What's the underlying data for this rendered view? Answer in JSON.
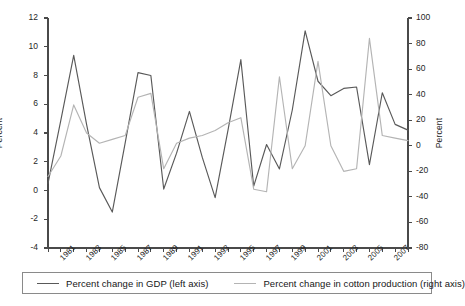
{
  "chart_data": {
    "type": "line",
    "title": "",
    "xlabel": "",
    "ylabel": "Percent",
    "y2label": "Percent",
    "grid": false,
    "legend_position": "bottom",
    "x": [
      1980,
      1981,
      1982,
      1983,
      1984,
      1985,
      1986,
      1987,
      1988,
      1989,
      1990,
      1991,
      1992,
      1993,
      1994,
      1995,
      1996,
      1997,
      1998,
      1999,
      2000,
      2001,
      2002,
      2003,
      2004,
      2005,
      2006,
      2007,
      2008
    ],
    "tick_labels": [
      "1981",
      "1983",
      "1985",
      "1987",
      "1989",
      "1991",
      "1993",
      "1995",
      "1997",
      "1999",
      "2001",
      "2003",
      "2005",
      "2007"
    ],
    "tick_values": [
      1981,
      1983,
      1985,
      1987,
      1989,
      1991,
      1993,
      1995,
      1997,
      1999,
      2001,
      2003,
      2005,
      2007
    ],
    "ylim": [
      -4,
      12
    ],
    "yticks": [
      -4,
      -2,
      0,
      2,
      4,
      6,
      8,
      10,
      12
    ],
    "y2lim": [
      -80,
      100
    ],
    "y2ticks": [
      -80,
      -60,
      -40,
      -20,
      0,
      20,
      40,
      60,
      80,
      100
    ],
    "series": [
      {
        "name": "Percent change in GDP (left axis)",
        "axis": "left",
        "color": "#595959",
        "values": [
          0.5,
          4.9,
          9.4,
          4.6,
          0.2,
          -1.5,
          3.3,
          8.2,
          8.0,
          0.1,
          2.6,
          5.5,
          2.3,
          -0.5,
          4.2,
          9.1,
          0.3,
          3.2,
          1.5,
          5.6,
          11.1,
          7.6,
          6.6,
          7.1,
          7.2,
          1.8,
          6.8,
          4.6,
          4.2
        ]
      },
      {
        "name": "Percent change in cotton production (right axis)",
        "axis": "right",
        "color": "#b4b4b4",
        "values": [
          -24,
          -8,
          32,
          10,
          2,
          5,
          8,
          38,
          41,
          -18,
          2,
          6,
          8,
          12,
          18,
          22,
          -34,
          -36,
          54,
          -18,
          0,
          66,
          0,
          -20,
          -18,
          84,
          8,
          6,
          4
        ]
      }
    ],
    "series2_right_tail": [
      10,
      7,
      4,
      -56,
      44
    ]
  },
  "axes": {
    "left_title": "Percent",
    "right_title": "Percent"
  },
  "legend": {
    "entries": [
      {
        "label": "Percent change in GDP (left axis)",
        "color": "#595959"
      },
      {
        "label": "Percent change in cotton production (right axis)",
        "color": "#b4b4b4"
      }
    ]
  },
  "footer": {
    "fragment": ""
  },
  "colors": {
    "gdp_line": "#595959",
    "cotton_line": "#b4b4b4",
    "axis": "#4a4a4a",
    "text": "#1f1f1f",
    "legend_border": "#8a8a8a"
  }
}
